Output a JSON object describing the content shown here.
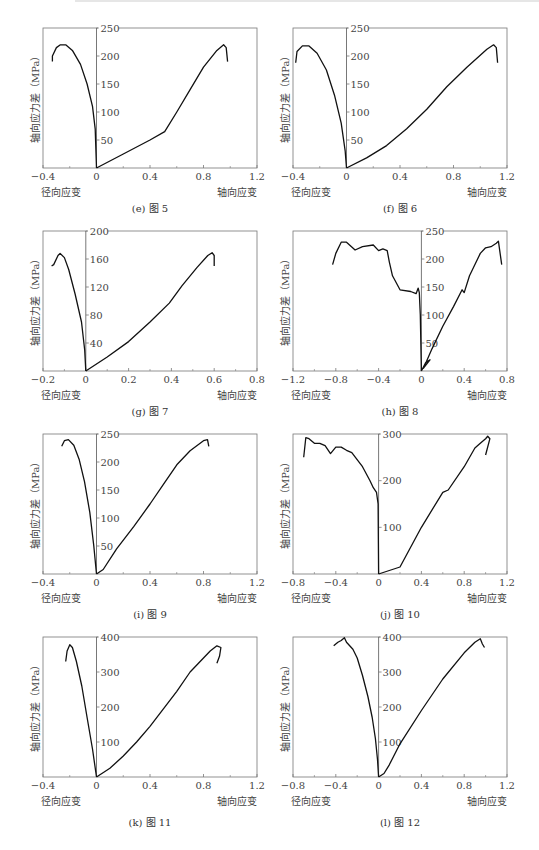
{
  "figure": {
    "ylabel": "轴向应力差（MPa）",
    "xlabel_left": "径向应变",
    "xlabel_right": "轴向应变"
  },
  "chart_data": [
    {
      "id": "e",
      "type": "line",
      "caption": "(e) 图 5",
      "xlabel_left": "径向应变",
      "xlabel_right": "轴向应变",
      "ylabel": "轴向应力差（MPa）",
      "xlim": [
        -0.4,
        1.2
      ],
      "ylim": [
        0,
        250
      ],
      "xticks": [
        "-0.4",
        "0",
        "0.4",
        "0.8",
        "1.2"
      ],
      "yticks": [
        "50",
        "100",
        "150",
        "200",
        "250"
      ],
      "series": [
        {
          "name": "径向应变",
          "x": [
            0,
            -0.01,
            -0.03,
            -0.07,
            -0.12,
            -0.18,
            -0.23,
            -0.27,
            -0.3,
            -0.33,
            -0.33
          ],
          "y": [
            0,
            70,
            110,
            150,
            185,
            210,
            220,
            220,
            215,
            200,
            190
          ]
        },
        {
          "name": "轴向应变",
          "x": [
            0,
            0.2,
            0.4,
            0.51,
            0.6,
            0.7,
            0.8,
            0.9,
            0.95,
            0.97,
            0.98
          ],
          "y": [
            0,
            25,
            50,
            65,
            100,
            140,
            180,
            210,
            220,
            215,
            190
          ]
        }
      ]
    },
    {
      "id": "f",
      "type": "line",
      "caption": "(f) 图 6",
      "xlabel_left": "径向应变",
      "xlabel_right": "轴向应变",
      "ylabel": "轴向应力差（MPa）",
      "xlim": [
        -0.4,
        1.2
      ],
      "ylim": [
        0,
        250
      ],
      "xticks": [
        "-0.4",
        "0",
        "0.4",
        "0.8",
        "1.2"
      ],
      "yticks": [
        "50",
        "100",
        "150",
        "200",
        "250"
      ],
      "series": [
        {
          "name": "径向应变",
          "x": [
            0,
            -0.01,
            -0.04,
            -0.09,
            -0.15,
            -0.22,
            -0.28,
            -0.33,
            -0.37,
            -0.38
          ],
          "y": [
            0,
            30,
            80,
            130,
            175,
            205,
            218,
            218,
            208,
            188
          ]
        },
        {
          "name": "轴向应变",
          "x": [
            0,
            0.15,
            0.3,
            0.45,
            0.6,
            0.75,
            0.9,
            1.05,
            1.1,
            1.12,
            1.13
          ],
          "y": [
            0,
            18,
            40,
            70,
            105,
            145,
            180,
            212,
            220,
            215,
            188
          ]
        }
      ]
    },
    {
      "id": "g",
      "type": "line",
      "caption": "(g) 图 7",
      "xlabel_left": "径向应变",
      "xlabel_right": "轴向应变",
      "ylabel": "轴向应力差（MPa）",
      "xlim": [
        -0.2,
        0.8
      ],
      "ylim": [
        0,
        200
      ],
      "xticks": [
        "-0.2",
        "0",
        "0.2",
        "0.4",
        "0.6",
        "0.8"
      ],
      "yticks": [
        "40",
        "80",
        "120",
        "160",
        "200"
      ],
      "series": [
        {
          "name": "径向应变",
          "x": [
            0,
            -0.005,
            -0.02,
            -0.05,
            -0.08,
            -0.1,
            -0.12,
            -0.13,
            -0.15,
            -0.16
          ],
          "y": [
            0,
            30,
            70,
            110,
            145,
            162,
            168,
            165,
            152,
            150
          ]
        },
        {
          "name": "轴向应变",
          "x": [
            0,
            0.1,
            0.2,
            0.3,
            0.39,
            0.45,
            0.52,
            0.57,
            0.59,
            0.6,
            0.6
          ],
          "y": [
            0,
            20,
            42,
            70,
            97,
            122,
            148,
            165,
            169,
            165,
            150
          ]
        }
      ]
    },
    {
      "id": "h",
      "type": "line",
      "caption": "(h) 图 8",
      "xlabel_left": "径向应变",
      "xlabel_right": "轴向应变",
      "ylabel": "轴向应力差（MPa）",
      "xlim": [
        -1.2,
        0.8
      ],
      "ylim": [
        0,
        250
      ],
      "xticks": [
        "-1.2",
        "-0.8",
        "-0.4",
        "0",
        "0.4",
        "0.8"
      ],
      "yticks": [
        "50",
        "100",
        "150",
        "200",
        "250"
      ],
      "series": [
        {
          "name": "径向应变",
          "x": [
            0,
            -0.01,
            -0.02,
            -0.03,
            -0.05,
            -0.1,
            -0.2,
            -0.27,
            -0.3,
            -0.32,
            -0.36,
            -0.4,
            -0.45,
            -0.55,
            -0.62,
            -0.7,
            -0.75,
            -0.8,
            -0.83
          ],
          "y": [
            0,
            100,
            140,
            148,
            138,
            142,
            145,
            170,
            195,
            215,
            218,
            215,
            225,
            222,
            216,
            230,
            230,
            210,
            190
          ]
        },
        {
          "name": "轴向应变",
          "x": [
            0,
            0.04,
            0.08,
            0.02,
            0.1,
            0.2,
            0.3,
            0.38,
            0.4,
            0.45,
            0.55,
            0.6,
            0.65,
            0.7,
            0.72,
            0.75
          ],
          "y": [
            0,
            15,
            20,
            5,
            40,
            80,
            115,
            145,
            140,
            170,
            210,
            220,
            222,
            228,
            232,
            190
          ]
        }
      ]
    },
    {
      "id": "i",
      "type": "line",
      "caption": "(i) 图 9",
      "xlabel_left": "径向应变",
      "xlabel_right": "轴向应变",
      "ylabel": "轴向应力差（MPa）",
      "xlim": [
        -0.4,
        1.2
      ],
      "ylim": [
        0,
        250
      ],
      "xticks": [
        "-0.4",
        "0",
        "0.4",
        "0.8",
        "1.2"
      ],
      "yticks": [
        "50",
        "100",
        "150",
        "200",
        "250"
      ],
      "series": [
        {
          "name": "径向应变",
          "x": [
            0,
            -0.02,
            -0.05,
            -0.09,
            -0.13,
            -0.17,
            -0.21,
            -0.24,
            -0.26
          ],
          "y": [
            0,
            50,
            110,
            165,
            205,
            230,
            240,
            238,
            228
          ]
        },
        {
          "name": "轴向应变",
          "x": [
            0,
            0.05,
            0.15,
            0.28,
            0.4,
            0.5,
            0.6,
            0.7,
            0.8,
            0.83,
            0.84
          ],
          "y": [
            0,
            8,
            45,
            85,
            125,
            160,
            195,
            220,
            238,
            240,
            228
          ]
        }
      ]
    },
    {
      "id": "j",
      "type": "line",
      "caption": "(j) 图 10",
      "xlabel_left": "径向应变",
      "xlabel_right": "轴向应变",
      "ylabel": "轴向应力差（MPa）",
      "xlim": [
        -0.8,
        1.2
      ],
      "ylim": [
        0,
        300
      ],
      "xticks": [
        "-0.8",
        "-0.4",
        "0",
        "0.4",
        "0.8",
        "1.2"
      ],
      "yticks": [
        "100",
        "200",
        "300"
      ],
      "series": [
        {
          "name": "径向应变",
          "x": [
            0,
            -0.005,
            -0.02,
            -0.05,
            -0.08,
            -0.15,
            -0.25,
            -0.3,
            -0.35,
            -0.4,
            -0.45,
            -0.5,
            -0.55,
            -0.6,
            -0.65,
            -0.68,
            -0.7
          ],
          "y": [
            0,
            150,
            175,
            185,
            200,
            230,
            260,
            265,
            272,
            272,
            258,
            275,
            280,
            280,
            290,
            292,
            250
          ]
        },
        {
          "name": "轴向应变",
          "x": [
            0,
            0.2,
            0.4,
            0.6,
            0.65,
            0.8,
            0.9,
            0.95,
            1.0,
            1.02,
            1.04,
            1.0
          ],
          "y": [
            0,
            15,
            100,
            175,
            180,
            230,
            270,
            280,
            290,
            295,
            290,
            255
          ]
        }
      ]
    },
    {
      "id": "k",
      "type": "line",
      "caption": "(k) 图 11",
      "xlabel_left": "径向应变",
      "xlabel_right": "轴向应变",
      "ylabel": "轴向应力差（MPa）",
      "xlim": [
        -0.4,
        1.2
      ],
      "ylim": [
        0,
        400
      ],
      "xticks": [
        "-0.4",
        "0",
        "0.4",
        "0.8",
        "1.2"
      ],
      "yticks": [
        "100",
        "200",
        "300",
        "400"
      ],
      "series": [
        {
          "name": "径向应变",
          "x": [
            0,
            -0.03,
            -0.07,
            -0.11,
            -0.15,
            -0.18,
            -0.2,
            -0.22,
            -0.23
          ],
          "y": [
            0,
            80,
            170,
            260,
            330,
            370,
            378,
            360,
            330
          ]
        },
        {
          "name": "轴向应变",
          "x": [
            0,
            0.1,
            0.2,
            0.3,
            0.4,
            0.5,
            0.6,
            0.7,
            0.75,
            0.8,
            0.85,
            0.9,
            0.93,
            0.92,
            0.9
          ],
          "y": [
            0,
            25,
            60,
            100,
            145,
            195,
            245,
            300,
            320,
            340,
            360,
            375,
            370,
            345,
            325
          ]
        }
      ]
    },
    {
      "id": "l",
      "type": "line",
      "caption": "(l) 图 12",
      "xlabel_left": "径向应变",
      "xlabel_right": "轴向应变",
      "ylabel": "轴向应力差（MPa）",
      "xlim": [
        -0.8,
        1.2
      ],
      "ylim": [
        0,
        400
      ],
      "xticks": [
        "-0.8",
        "-0.4",
        "0",
        "0.4",
        "0.8",
        "1.2"
      ],
      "yticks": [
        "100",
        "200",
        "300",
        "400"
      ],
      "series": [
        {
          "name": "径向应变",
          "x": [
            0,
            -0.01,
            -0.03,
            -0.06,
            -0.1,
            -0.15,
            -0.2,
            -0.24,
            -0.27,
            -0.3,
            -0.32,
            -0.35,
            -0.38,
            -0.42
          ],
          "y": [
            0,
            50,
            110,
            170,
            230,
            290,
            340,
            365,
            375,
            385,
            398,
            390,
            385,
            375
          ]
        },
        {
          "name": "轴向应变",
          "x": [
            0,
            0.05,
            0.1,
            0.2,
            0.4,
            0.6,
            0.8,
            0.9,
            0.95,
            0.97,
            0.99
          ],
          "y": [
            0,
            10,
            35,
            95,
            190,
            280,
            355,
            385,
            395,
            380,
            370
          ]
        }
      ]
    }
  ]
}
